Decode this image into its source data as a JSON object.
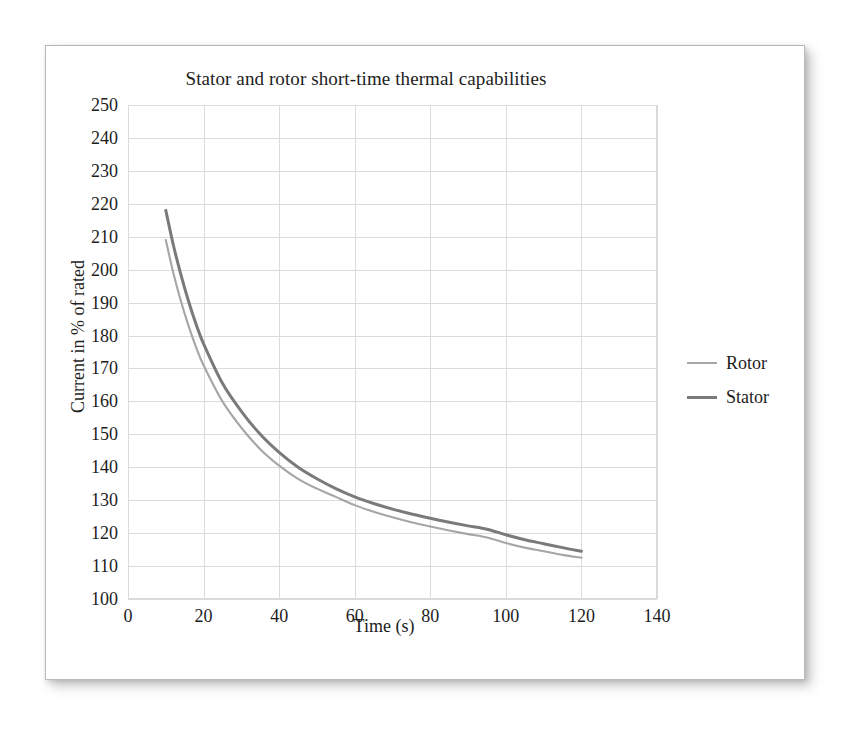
{
  "chart_data": {
    "type": "line",
    "title": "Stator and rotor short-time thermal capabilities",
    "xlabel": "Time (s)",
    "ylabel": "Current in % of rated",
    "xlim": [
      0,
      140
    ],
    "ylim": [
      100,
      250
    ],
    "xticks": [
      0,
      20,
      40,
      60,
      80,
      100,
      120,
      140
    ],
    "yticks": [
      100,
      110,
      120,
      130,
      140,
      150,
      160,
      170,
      180,
      190,
      200,
      210,
      220,
      230,
      240,
      250
    ],
    "grid": true,
    "legend_position": "right",
    "series": [
      {
        "name": "Rotor",
        "color": "#a6a6a6",
        "x": [
          10,
          12,
          14,
          16,
          18,
          20,
          25,
          30,
          35,
          40,
          45,
          50,
          55,
          60,
          65,
          70,
          75,
          80,
          85,
          90,
          95,
          100,
          105,
          110,
          115,
          120
        ],
        "y": [
          209.0,
          199.0,
          190.5,
          183.0,
          176.5,
          171.0,
          160.0,
          152.0,
          145.5,
          140.5,
          136.5,
          133.5,
          131.0,
          128.5,
          126.5,
          124.8,
          123.3,
          122.0,
          120.8,
          119.7,
          118.7,
          117.0,
          115.6,
          114.5,
          113.4,
          112.5
        ]
      },
      {
        "name": "Stator",
        "color": "#7a7a7a",
        "x": [
          10,
          12,
          14,
          16,
          18,
          20,
          25,
          30,
          35,
          40,
          45,
          50,
          55,
          60,
          65,
          70,
          75,
          80,
          85,
          90,
          95,
          100,
          105,
          110,
          115,
          120
        ],
        "y": [
          218.0,
          207.5,
          198.5,
          190.5,
          183.5,
          177.5,
          165.5,
          157.0,
          150.0,
          144.5,
          140.0,
          136.5,
          133.5,
          131.0,
          129.0,
          127.3,
          125.8,
          124.5,
          123.3,
          122.2,
          121.2,
          119.5,
          118.0,
          116.8,
          115.6,
          114.5
        ]
      }
    ]
  },
  "legend": {
    "entries": [
      {
        "label": "Rotor",
        "color": "#a6a6a6",
        "thickness": "2px"
      },
      {
        "label": "Stator",
        "color": "#7a7a7a",
        "thickness": "3px"
      }
    ]
  },
  "colors": {
    "rotor": "#a6a6a6",
    "stator": "#7a7a7a",
    "gridline": "#dcdcdc",
    "plot_border": "#d8d8d8",
    "text": "#1d1d1d",
    "page": "#ffffff"
  }
}
